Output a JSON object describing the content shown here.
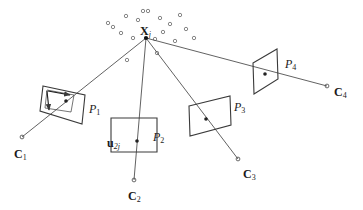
{
  "figure": {
    "background_color": "#ffffff",
    "line_color": "#3a3a3a",
    "text_color": "#1a1a1a",
    "width": 363,
    "height": 210
  },
  "labels": {
    "world_point": {
      "base": "X",
      "sub": "j",
      "x": 140,
      "y": 25
    },
    "image_point": {
      "base": "u",
      "sub": "2j",
      "x": 107,
      "y": 137
    },
    "camera_centers": [
      {
        "base": "C",
        "sub": "1",
        "x": 14,
        "y": 148
      },
      {
        "base": "C",
        "sub": "2",
        "x": 128,
        "y": 190
      },
      {
        "base": "C",
        "sub": "3",
        "x": 243,
        "y": 168
      },
      {
        "base": "C",
        "sub": "4",
        "x": 334,
        "y": 86
      }
    ],
    "projection_matrices": [
      {
        "base": "P",
        "sub": "1",
        "x": 89,
        "y": 103
      },
      {
        "base": "P",
        "sub": "2",
        "x": 153,
        "y": 131
      },
      {
        "base": "P",
        "sub": "3",
        "x": 234,
        "y": 101
      },
      {
        "base": "P",
        "sub": "4",
        "x": 285,
        "y": 58
      }
    ]
  },
  "geometry": {
    "world_point_marker": {
      "x": 146,
      "y": 38,
      "r": 2.1
    },
    "cloud_points": [
      {
        "x": 126,
        "y": 16
      },
      {
        "x": 148,
        "y": 11
      },
      {
        "x": 160,
        "y": 18
      },
      {
        "x": 113,
        "y": 27
      },
      {
        "x": 170,
        "y": 24
      },
      {
        "x": 138,
        "y": 20
      },
      {
        "x": 180,
        "y": 15
      },
      {
        "x": 121,
        "y": 33
      },
      {
        "x": 163,
        "y": 32
      },
      {
        "x": 186,
        "y": 29
      },
      {
        "x": 133,
        "y": 38
      },
      {
        "x": 155,
        "y": 39
      },
      {
        "x": 175,
        "y": 41
      },
      {
        "x": 127,
        "y": 60
      },
      {
        "x": 157,
        "y": 53
      },
      {
        "x": 143,
        "y": 11
      },
      {
        "x": 194,
        "y": 38
      },
      {
        "x": 108,
        "y": 23
      }
    ],
    "cloud_point_radius": 1.7,
    "rays": [
      {
        "name": "ray-c1",
        "from": {
          "x": 146,
          "y": 38
        },
        "to": {
          "x": 22,
          "y": 137
        }
      },
      {
        "name": "ray-c2",
        "from": {
          "x": 146,
          "y": 38
        },
        "to": {
          "x": 134,
          "y": 180
        }
      },
      {
        "name": "ray-c3",
        "from": {
          "x": 146,
          "y": 38
        },
        "to": {
          "x": 238,
          "y": 159
        }
      },
      {
        "name": "ray-c4",
        "from": {
          "x": 146,
          "y": 38
        },
        "to": {
          "x": 327,
          "y": 86
        }
      }
    ],
    "camera_center_markers": [
      {
        "x": 22,
        "y": 137,
        "r": 1.9
      },
      {
        "x": 134,
        "y": 180,
        "r": 1.9
      },
      {
        "x": 238,
        "y": 159,
        "r": 1.9
      },
      {
        "x": 327,
        "y": 86,
        "r": 1.9
      }
    ],
    "image_planes": [
      {
        "name": "image-plane-p1",
        "points": "43,86 85,95 82,124 40,111",
        "projected_point": {
          "x": 66,
          "y": 101,
          "r": 1.8
        }
      },
      {
        "name": "image-plane-p2",
        "points": "111,118 157,118 157,152 111,152",
        "projected_point": {
          "x": 137,
          "y": 141,
          "r": 1.8
        }
      },
      {
        "name": "image-plane-p3",
        "points": "189,106 230,96 231,125 190,136",
        "projected_point": {
          "x": 206,
          "y": 119,
          "r": 1.8
        }
      },
      {
        "name": "image-plane-p4",
        "points": "253,63 277,49 278,79 254,94",
        "projected_point": {
          "x": 265,
          "y": 74,
          "r": 1.8
        }
      }
    ],
    "axes_frame": {
      "name": "image-coordinate-frame-p1",
      "outline": "47,90 74,95 71,112 45,108",
      "origin": {
        "x": 47,
        "y": 91
      },
      "u_axis_arrow": {
        "x1": 48,
        "y1": 91,
        "x2": 70,
        "y2": 95
      },
      "v_axis_arrow": {
        "x1": 47,
        "y1": 91,
        "x2": 49,
        "y2": 110
      }
    }
  }
}
